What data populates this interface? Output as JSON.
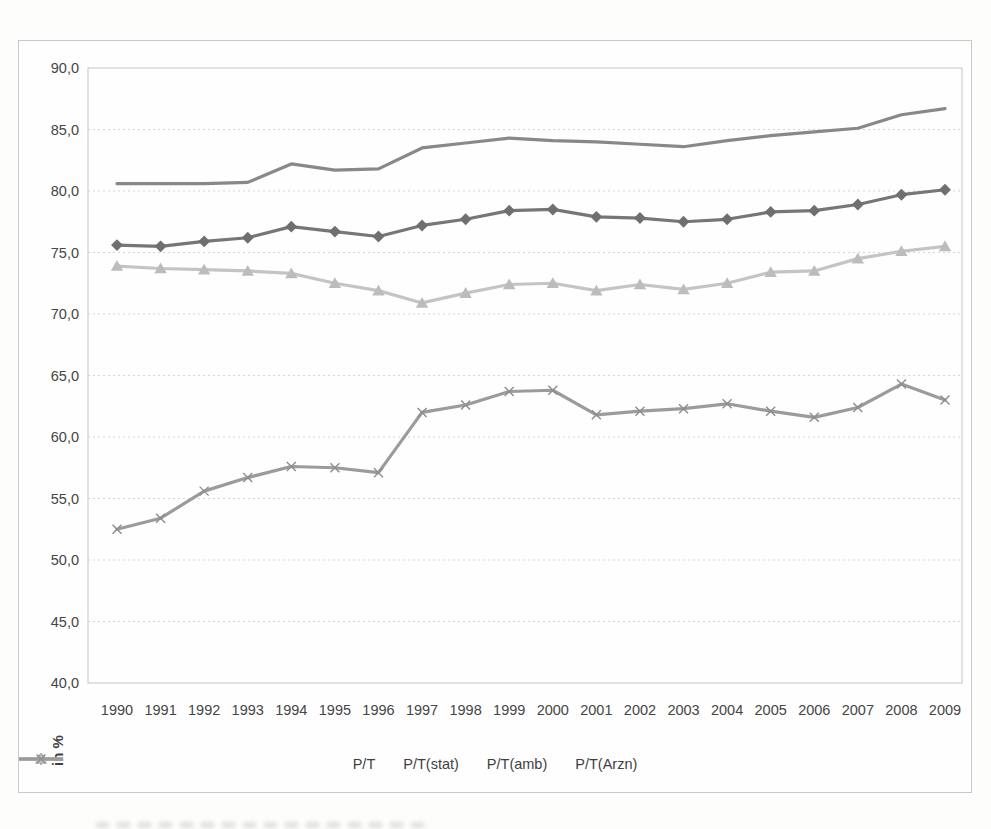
{
  "colors": {
    "background": "#fdfdfc",
    "frame_border": "#c9c9c9",
    "plot_border": "#c4c4c4",
    "grid": "#d4d4d4",
    "axis_text": "#454545"
  },
  "chart_data": {
    "type": "line",
    "title": "",
    "xlabel": "",
    "ylabel": "in %",
    "ylim": [
      40,
      90
    ],
    "grid": true,
    "legend_position": "bottom",
    "decimal_separator": ",",
    "x": [
      1990,
      1991,
      1992,
      1993,
      1994,
      1995,
      1996,
      1997,
      1998,
      1999,
      2000,
      2001,
      2002,
      2003,
      2004,
      2005,
      2006,
      2007,
      2008,
      2009
    ],
    "ytick_values": [
      90,
      85,
      80,
      75,
      70,
      65,
      60,
      55,
      50,
      45,
      40
    ],
    "ytick_labels": [
      "90,0",
      "85,0",
      "80,0",
      "75,0",
      "70,0",
      "65,0",
      "60,0",
      "55,0",
      "50,0",
      "45,0",
      "40,0"
    ],
    "series": [
      {
        "name": "P/T",
        "marker": "diamond",
        "color": "#767676",
        "marker_color": "#6f6f6f",
        "values": [
          75.6,
          75.5,
          75.9,
          76.2,
          77.1,
          76.7,
          76.3,
          77.2,
          77.7,
          78.4,
          78.5,
          77.9,
          77.8,
          77.5,
          77.7,
          78.3,
          78.4,
          78.9,
          79.7,
          80.1
        ]
      },
      {
        "name": "P/T(stat)",
        "marker": "none",
        "color": "#888888",
        "marker_color": "#888888",
        "values": [
          80.6,
          80.6,
          80.6,
          80.7,
          82.2,
          81.7,
          81.8,
          83.5,
          83.9,
          84.3,
          84.1,
          84.0,
          83.8,
          83.6,
          84.1,
          84.5,
          84.8,
          85.1,
          86.2,
          86.7
        ]
      },
      {
        "name": "P/T(amb)",
        "marker": "triangle",
        "color": "#c4c4c4",
        "marker_color": "#bcbcbc",
        "values": [
          73.9,
          73.7,
          73.6,
          73.5,
          73.3,
          72.5,
          71.9,
          70.9,
          71.7,
          72.4,
          72.5,
          71.9,
          72.4,
          72.0,
          72.5,
          73.4,
          73.5,
          74.5,
          75.1,
          75.5
        ]
      },
      {
        "name": "P/T(Arzn)",
        "marker": "x",
        "color": "#9b9b9b",
        "marker_color": "#8d8d8d",
        "values": [
          52.5,
          53.4,
          55.6,
          56.7,
          57.6,
          57.5,
          57.1,
          62.0,
          62.6,
          63.7,
          63.8,
          61.8,
          62.1,
          62.3,
          62.7,
          62.1,
          61.6,
          62.4,
          64.3,
          63.0
        ]
      }
    ]
  }
}
